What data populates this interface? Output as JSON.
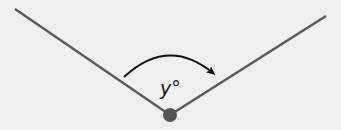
{
  "diagram": {
    "type": "angle",
    "angle_label": "y°",
    "vertex": {
      "x": 170,
      "y": 115
    },
    "ray_left_end": {
      "x": 15,
      "y": 9
    },
    "ray_right_end": {
      "x": 326,
      "y": 16
    },
    "colors": {
      "background": "#efefef",
      "rays": "#5a5a5a",
      "vertex_dot": "#555555",
      "arc": "#111111"
    },
    "arc": {
      "direction": "clockwise",
      "has_arrowhead": true
    }
  }
}
